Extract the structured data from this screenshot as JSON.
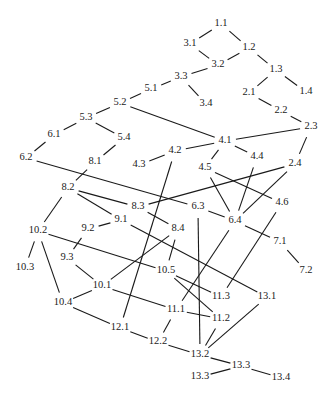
{
  "diagram": {
    "type": "dependency-graph",
    "nodes": [
      {
        "id": "1.1",
        "label": "1.1",
        "x": 221,
        "y": 24
      },
      {
        "id": "1.2",
        "label": "1.2",
        "x": 249,
        "y": 48
      },
      {
        "id": "1.3",
        "label": "1.3",
        "x": 276,
        "y": 70
      },
      {
        "id": "1.4",
        "label": "1.4",
        "x": 306,
        "y": 92
      },
      {
        "id": "2.1",
        "label": "2.1",
        "x": 249,
        "y": 93
      },
      {
        "id": "2.2",
        "label": "2.2",
        "x": 281,
        "y": 111
      },
      {
        "id": "2.3",
        "label": "2.3",
        "x": 311,
        "y": 127
      },
      {
        "id": "2.4",
        "label": "2.4",
        "x": 295,
        "y": 164
      },
      {
        "id": "3.1",
        "label": "3.1",
        "x": 190,
        "y": 44
      },
      {
        "id": "3.2",
        "label": "3.2",
        "x": 218,
        "y": 65
      },
      {
        "id": "3.3",
        "label": "3.3",
        "x": 181,
        "y": 77
      },
      {
        "id": "3.4",
        "label": "3.4",
        "x": 206,
        "y": 104
      },
      {
        "id": "4.1",
        "label": "4.1",
        "x": 225,
        "y": 141
      },
      {
        "id": "4.2",
        "label": "4.2",
        "x": 175,
        "y": 151
      },
      {
        "id": "4.3",
        "label": "4.3",
        "x": 139,
        "y": 165
      },
      {
        "id": "4.4",
        "label": "4.4",
        "x": 257,
        "y": 157
      },
      {
        "id": "4.5",
        "label": "4.5",
        "x": 205,
        "y": 168
      },
      {
        "id": "4.6",
        "label": "4.6",
        "x": 282,
        "y": 203
      },
      {
        "id": "5.1",
        "label": "5.1",
        "x": 151,
        "y": 89
      },
      {
        "id": "5.2",
        "label": "5.2",
        "x": 120,
        "y": 103
      },
      {
        "id": "5.3",
        "label": "5.3",
        "x": 86,
        "y": 118
      },
      {
        "id": "5.4",
        "label": "5.4",
        "x": 124,
        "y": 138
      },
      {
        "id": "6.1",
        "label": "6.1",
        "x": 54,
        "y": 135
      },
      {
        "id": "6.2",
        "label": "6.2",
        "x": 26,
        "y": 158
      },
      {
        "id": "6.3",
        "label": "6.3",
        "x": 198,
        "y": 207
      },
      {
        "id": "6.4",
        "label": "6.4",
        "x": 235,
        "y": 221
      },
      {
        "id": "7.1",
        "label": "7.1",
        "x": 280,
        "y": 242
      },
      {
        "id": "7.2",
        "label": "7.2",
        "x": 306,
        "y": 271
      },
      {
        "id": "8.1",
        "label": "8.1",
        "x": 95,
        "y": 162
      },
      {
        "id": "8.2",
        "label": "8.2",
        "x": 68,
        "y": 188
      },
      {
        "id": "8.3",
        "label": "8.3",
        "x": 138,
        "y": 207
      },
      {
        "id": "8.4",
        "label": "8.4",
        "x": 178,
        "y": 229
      },
      {
        "id": "9.1",
        "label": "9.1",
        "x": 121,
        "y": 220
      },
      {
        "id": "9.2",
        "label": "9.2",
        "x": 88,
        "y": 229
      },
      {
        "id": "9.3",
        "label": "9.3",
        "x": 67,
        "y": 258
      },
      {
        "id": "10.1",
        "label": "10.1",
        "x": 102,
        "y": 286
      },
      {
        "id": "10.2",
        "label": "10.2",
        "x": 38,
        "y": 231
      },
      {
        "id": "10.3",
        "label": "10.3",
        "x": 25,
        "y": 268
      },
      {
        "id": "10.4",
        "label": "10.4",
        "x": 63,
        "y": 303
      },
      {
        "id": "10.5",
        "label": "10.5",
        "x": 166,
        "y": 271
      },
      {
        "id": "11.1",
        "label": "11.1",
        "x": 176,
        "y": 310
      },
      {
        "id": "11.2",
        "label": "11.2",
        "x": 221,
        "y": 319
      },
      {
        "id": "11.3",
        "label": "11.3",
        "x": 221,
        "y": 297
      },
      {
        "id": "12.1",
        "label": "12.1",
        "x": 120,
        "y": 328
      },
      {
        "id": "12.2",
        "label": "12.2",
        "x": 158,
        "y": 342
      },
      {
        "id": "13.1",
        "label": "13.1",
        "x": 267,
        "y": 297
      },
      {
        "id": "13.2",
        "label": "13.2",
        "x": 200,
        "y": 355
      },
      {
        "id": "13.3",
        "label": "13.3",
        "x": 241,
        "y": 366
      },
      {
        "id": "13.3b",
        "label": "13.3",
        "x": 200,
        "y": 377
      },
      {
        "id": "13.4",
        "label": "13.4",
        "x": 281,
        "y": 378
      }
    ],
    "edges": [
      [
        "1.1",
        "3.1"
      ],
      [
        "1.1",
        "1.2"
      ],
      [
        "3.1",
        "3.2"
      ],
      [
        "3.2",
        "1.2"
      ],
      [
        "1.2",
        "1.3"
      ],
      [
        "1.3",
        "1.4"
      ],
      [
        "1.3",
        "2.1"
      ],
      [
        "2.1",
        "2.2"
      ],
      [
        "2.2",
        "2.3"
      ],
      [
        "2.3",
        "4.1"
      ],
      [
        "2.3",
        "2.4"
      ],
      [
        "3.2",
        "3.3"
      ],
      [
        "3.3",
        "3.4"
      ],
      [
        "3.3",
        "5.1"
      ],
      [
        "5.1",
        "5.2"
      ],
      [
        "5.2",
        "4.1"
      ],
      [
        "5.2",
        "5.3"
      ],
      [
        "5.3",
        "6.1"
      ],
      [
        "5.3",
        "5.4"
      ],
      [
        "6.1",
        "6.2"
      ],
      [
        "5.4",
        "8.1"
      ],
      [
        "8.1",
        "8.2"
      ],
      [
        "6.2",
        "6.3"
      ],
      [
        "4.1",
        "4.2"
      ],
      [
        "4.1",
        "4.4"
      ],
      [
        "4.1",
        "4.5"
      ],
      [
        "4.2",
        "4.3"
      ],
      [
        "4.2",
        "12.1"
      ],
      [
        "4.5",
        "6.4"
      ],
      [
        "4.5",
        "4.6"
      ],
      [
        "4.4",
        "6.4"
      ],
      [
        "2.4",
        "6.4"
      ],
      [
        "2.4",
        "8.3"
      ],
      [
        "4.6",
        "11.3"
      ],
      [
        "6.3",
        "6.4"
      ],
      [
        "6.3",
        "13.2"
      ],
      [
        "6.4",
        "7.1"
      ],
      [
        "6.4",
        "11.1"
      ],
      [
        "7.1",
        "7.2"
      ],
      [
        "8.2",
        "8.3"
      ],
      [
        "8.2",
        "9.1"
      ],
      [
        "8.2",
        "10.2"
      ],
      [
        "8.3",
        "8.4"
      ],
      [
        "8.4",
        "10.1"
      ],
      [
        "8.4",
        "10.5"
      ],
      [
        "9.1",
        "9.2"
      ],
      [
        "9.1",
        "13.1"
      ],
      [
        "9.2",
        "9.3"
      ],
      [
        "9.3",
        "10.1"
      ],
      [
        "10.2",
        "10.3"
      ],
      [
        "10.2",
        "10.4"
      ],
      [
        "10.2",
        "10.5"
      ],
      [
        "10.1",
        "10.4"
      ],
      [
        "10.1",
        "11.1"
      ],
      [
        "10.4",
        "12.1"
      ],
      [
        "10.5",
        "11.3"
      ],
      [
        "10.5",
        "11.2"
      ],
      [
        "11.1",
        "11.2"
      ],
      [
        "11.1",
        "12.2"
      ],
      [
        "12.1",
        "12.2"
      ],
      [
        "12.2",
        "13.2"
      ],
      [
        "11.2",
        "13.2"
      ],
      [
        "13.1",
        "13.2"
      ],
      [
        "13.2",
        "13.3"
      ],
      [
        "13.3",
        "13.3b"
      ],
      [
        "13.3",
        "13.4"
      ]
    ]
  }
}
